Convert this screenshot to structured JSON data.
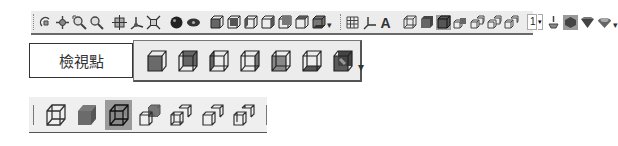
{
  "toolbar_top": {
    "groups": [
      {
        "name": "navigation",
        "icons": [
          "rotate-icon",
          "pan-icon",
          "zoom-window-icon",
          "zoom-icon"
        ]
      },
      {
        "name": "view-manip",
        "icons": [
          "orbit-icon",
          "axes-icon",
          "fit-view-icon"
        ]
      },
      {
        "name": "render",
        "icons": [
          "render-sphere-icon",
          "render-eye-icon"
        ]
      },
      {
        "name": "standard-views",
        "icons": [
          "view-iso-icon",
          "view-front-icon",
          "view-left-icon",
          "view-right-icon",
          "view-back-icon",
          "view-top-icon",
          "view-bottom-icon"
        ]
      },
      {
        "name": "display",
        "icons": [
          "grid-icon",
          "coordinate-icon",
          "text-icon"
        ]
      },
      {
        "name": "display-mode",
        "icons": [
          "wireframe-icon",
          "shaded-icon",
          "shaded-edges-icon",
          "cube-pair-1-icon",
          "cube-pair-2-icon",
          "cube-pair-3-icon",
          "cube-pair-4-icon"
        ]
      }
    ],
    "spinner_value": "1",
    "spinner_dropdown": "▾",
    "overflow": "▾",
    "end_icons": [
      "light-icon",
      "material-1-icon",
      "material-2-icon",
      "material-3-icon"
    ]
  },
  "viewpoint": {
    "label": "檢視點",
    "views": [
      {
        "name": "view-iso-icon",
        "label": "Isometric"
      },
      {
        "name": "view-front-icon",
        "label": "Front"
      },
      {
        "name": "view-left-icon",
        "label": "Left"
      },
      {
        "name": "view-right-icon",
        "label": "Right"
      },
      {
        "name": "view-back-icon",
        "label": "Back"
      },
      {
        "name": "view-top-icon",
        "label": "Top"
      },
      {
        "name": "view-bottom-icon",
        "label": "Bottom"
      }
    ],
    "overflow": "▾"
  },
  "display_mode": {
    "modes": [
      {
        "name": "wireframe-icon",
        "label": "Wireframe",
        "selected": false
      },
      {
        "name": "shaded-icon",
        "label": "Shaded",
        "selected": false
      },
      {
        "name": "shaded-edges-icon",
        "label": "Shaded with edges",
        "selected": true
      },
      {
        "name": "cube-pair-1-icon",
        "label": "Mode 4",
        "selected": false
      },
      {
        "name": "cube-pair-2-icon",
        "label": "Mode 5",
        "selected": false
      },
      {
        "name": "cube-pair-3-icon",
        "label": "Mode 6",
        "selected": false
      },
      {
        "name": "cube-pair-4-icon",
        "label": "Mode 7",
        "selected": false
      }
    ]
  },
  "colors": {
    "toolbar_bg": "#ececec",
    "selected_bg": "#9a9a9a",
    "cube_fill": "#6e6e6e",
    "cube_stroke": "#222222"
  }
}
